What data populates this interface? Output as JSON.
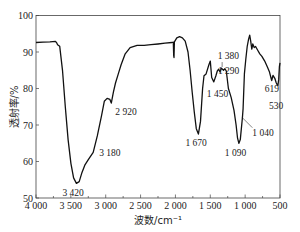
{
  "chart_data": {
    "type": "line",
    "title": "",
    "xlabel": "波数/cm⁻¹",
    "ylabel": "透射率/%",
    "xlim": [
      4000,
      500
    ],
    "ylim": [
      50,
      100
    ],
    "x_reversed": true,
    "grid": false,
    "legend": null,
    "xticks": [
      4000,
      3500,
      3000,
      2500,
      2000,
      1500,
      1000,
      500
    ],
    "xtick_labels": [
      "4 000",
      "3 500",
      "3 000",
      "2 500",
      "2 000",
      "1 500",
      "1 000",
      "500"
    ],
    "yticks": [
      50,
      60,
      70,
      80,
      90,
      100
    ],
    "ytick_labels": [
      "50",
      "60",
      "70",
      "80",
      "90",
      "100"
    ],
    "series": [
      {
        "name": "IR spectrum",
        "color": "#111111",
        "points": [
          [
            4000,
            92.6
          ],
          [
            3900,
            92.7
          ],
          [
            3800,
            92.8
          ],
          [
            3720,
            92.9
          ],
          [
            3700,
            92.4
          ],
          [
            3690,
            92.0
          ],
          [
            3660,
            91.6
          ],
          [
            3620,
            85.0
          ],
          [
            3580,
            75.0
          ],
          [
            3540,
            66.0
          ],
          [
            3500,
            59.5
          ],
          [
            3460,
            55.5
          ],
          [
            3420,
            54.0
          ],
          [
            3380,
            54.5
          ],
          [
            3340,
            57.0
          ],
          [
            3300,
            59.0
          ],
          [
            3250,
            60.5
          ],
          [
            3180,
            62.5
          ],
          [
            3120,
            67.0
          ],
          [
            3060,
            72.5
          ],
          [
            3020,
            76.5
          ],
          [
            2980,
            77.3
          ],
          [
            2940,
            77.0
          ],
          [
            2920,
            76.0
          ],
          [
            2890,
            79.0
          ],
          [
            2860,
            81.5
          ],
          [
            2820,
            84.0
          ],
          [
            2780,
            86.5
          ],
          [
            2720,
            89.5
          ],
          [
            2650,
            91.2
          ],
          [
            2550,
            91.8
          ],
          [
            2450,
            91.8
          ],
          [
            2350,
            92.0
          ],
          [
            2250,
            92.2
          ],
          [
            2150,
            92.4
          ],
          [
            2050,
            92.6
          ],
          [
            2030,
            92.7
          ],
          [
            2025,
            89.0
          ],
          [
            2020,
            88.5
          ],
          [
            2015,
            92.8
          ],
          [
            1980,
            93.9
          ],
          [
            1940,
            94.2
          ],
          [
            1900,
            93.9
          ],
          [
            1860,
            93.0
          ],
          [
            1820,
            90.0
          ],
          [
            1790,
            85.0
          ],
          [
            1760,
            79.0
          ],
          [
            1730,
            73.5
          ],
          [
            1700,
            69.0
          ],
          [
            1670,
            67.5
          ],
          [
            1640,
            71.0
          ],
          [
            1610,
            80.0
          ],
          [
            1590,
            83.5
          ],
          [
            1560,
            84.0
          ],
          [
            1520,
            86.5
          ],
          [
            1500,
            87.5
          ],
          [
            1480,
            83.0
          ],
          [
            1450,
            81.8
          ],
          [
            1420,
            83.5
          ],
          [
            1400,
            84.8
          ],
          [
            1380,
            85.3
          ],
          [
            1360,
            84.5
          ],
          [
            1340,
            85.6
          ],
          [
            1310,
            85.0
          ],
          [
            1290,
            85.4
          ],
          [
            1270,
            84.8
          ],
          [
            1240,
            80.0
          ],
          [
            1200,
            77.5
          ],
          [
            1160,
            74.0
          ],
          [
            1130,
            70.0
          ],
          [
            1110,
            66.5
          ],
          [
            1090,
            65.0
          ],
          [
            1070,
            66.0
          ],
          [
            1040,
            72.0
          ],
          [
            1030,
            74.5
          ],
          [
            1010,
            84.0
          ],
          [
            990,
            88.0
          ],
          [
            970,
            91.5
          ],
          [
            950,
            93.5
          ],
          [
            935,
            94.6
          ],
          [
            920,
            93.0
          ],
          [
            905,
            90.8
          ],
          [
            890,
            92.2
          ],
          [
            870,
            91.2
          ],
          [
            850,
            91.5
          ],
          [
            820,
            90.5
          ],
          [
            790,
            89.5
          ],
          [
            760,
            88.8
          ],
          [
            720,
            87.5
          ],
          [
            680,
            85.8
          ],
          [
            650,
            84.5
          ],
          [
            630,
            83.0
          ],
          [
            619,
            82.2
          ],
          [
            600,
            83.6
          ],
          [
            575,
            82.8
          ],
          [
            555,
            81.6
          ],
          [
            540,
            81.0
          ],
          [
            530,
            80.8
          ],
          [
            518,
            82.5
          ],
          [
            508,
            86.0
          ],
          [
            500,
            87.0
          ]
        ]
      }
    ],
    "annotations": [
      {
        "text": "3 420",
        "x": 3420,
        "y": 54.0
      },
      {
        "text": "3 180",
        "x": 3180,
        "y": 62.5
      },
      {
        "text": "2 920",
        "x": 2920,
        "y": 76.0
      },
      {
        "text": "1 670",
        "x": 1670,
        "y": 67.5
      },
      {
        "text": "1 450",
        "x": 1450,
        "y": 81.8
      },
      {
        "text": "1 380",
        "x": 1380,
        "y": 85.3
      },
      {
        "text": "1 290",
        "x": 1290,
        "y": 85.4
      },
      {
        "text": "1 090",
        "x": 1090,
        "y": 65.0
      },
      {
        "text": "1 040",
        "x": 1040,
        "y": 72.0
      },
      {
        "text": "619",
        "x": 619,
        "y": 82.2
      },
      {
        "text": "530",
        "x": 530,
        "y": 80.8
      }
    ]
  },
  "axes": {
    "x_title": "波数/cm⁻¹",
    "y_title": "透射率/%"
  }
}
